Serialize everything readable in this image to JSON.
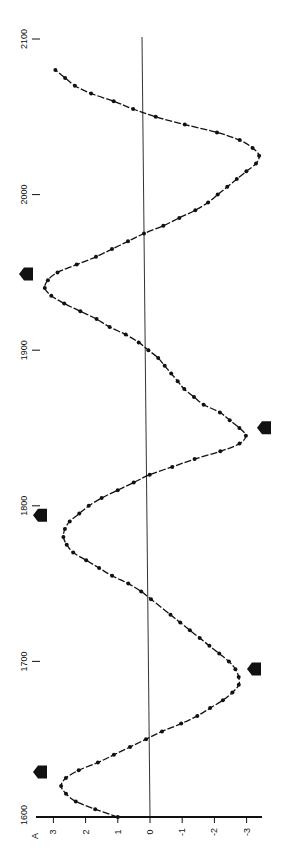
{
  "chart_data": {
    "type": "line",
    "orientation": "rotated-90-ccw",
    "title": "",
    "xlabel": "Year",
    "ylabel": "",
    "x_ticks": [
      "1600",
      "1700",
      "1800",
      "1900",
      "2000",
      "2100"
    ],
    "y_ticks": [
      "3",
      "2",
      "1",
      "0",
      "-1",
      "-2",
      "-3"
    ],
    "y_axis_marker": "A",
    "xlim": [
      1600,
      2100
    ],
    "ylim": [
      -3.7,
      3.3
    ],
    "grid": false,
    "reference_line": 0,
    "series": [
      {
        "name": "cycle",
        "marker": "dot",
        "x": [
          1600,
          1605,
          1610,
          1615,
          1620,
          1625,
          1630,
          1635,
          1640,
          1645,
          1650,
          1655,
          1660,
          1665,
          1670,
          1675,
          1680,
          1685,
          1690,
          1695,
          1700,
          1705,
          1710,
          1715,
          1720,
          1725,
          1730,
          1740,
          1745,
          1750,
          1755,
          1760,
          1765,
          1770,
          1775,
          1780,
          1785,
          1790,
          1795,
          1800,
          1805,
          1810,
          1815,
          1820,
          1825,
          1830,
          1835,
          1840,
          1845,
          1850,
          1855,
          1860,
          1865,
          1870,
          1875,
          1880,
          1885,
          1890,
          1895,
          1900,
          1905,
          1910,
          1915,
          1920,
          1925,
          1930,
          1935,
          1940,
          1945,
          1950,
          1955,
          1960,
          1965,
          1970,
          1975,
          1980,
          1985,
          1990,
          1995,
          2000,
          2005,
          2010,
          2015,
          2020,
          2025,
          2030,
          2035,
          2040,
          2045,
          2050,
          2055,
          2060,
          2065,
          2070,
          2075,
          2080
        ],
        "values": [
          1.0,
          1.7,
          2.3,
          2.6,
          2.75,
          2.6,
          2.2,
          1.6,
          1.1,
          0.6,
          0.1,
          -0.4,
          -1.0,
          -1.5,
          -1.9,
          -2.3,
          -2.6,
          -2.8,
          -2.8,
          -2.7,
          -2.5,
          -2.2,
          -1.9,
          -1.6,
          -1.3,
          -1.0,
          -0.7,
          -0.1,
          0.2,
          0.6,
          1.1,
          1.5,
          1.9,
          2.3,
          2.5,
          2.6,
          2.55,
          2.4,
          2.1,
          1.8,
          1.4,
          0.9,
          0.4,
          -0.1,
          -0.8,
          -1.5,
          -2.3,
          -2.9,
          -3.1,
          -2.9,
          -2.6,
          -2.3,
          -1.8,
          -1.5,
          -1.2,
          -1.0,
          -0.8,
          -0.6,
          -0.4,
          -0.1,
          0.2,
          0.6,
          1.1,
          1.5,
          2.0,
          2.5,
          2.9,
          3.1,
          3.0,
          2.7,
          2.1,
          1.5,
          1.0,
          0.5,
          0.0,
          -0.6,
          -1.1,
          -1.6,
          -2.0,
          -2.3,
          -2.6,
          -2.9,
          -3.2,
          -3.5,
          -3.6,
          -3.4,
          -3.0,
          -2.3,
          -1.3,
          -0.4,
          0.3,
          0.9,
          1.6,
          2.1,
          2.4,
          2.7
        ]
      }
    ],
    "annotations": [
      {
        "type": "arrow",
        "year": 1620,
        "side": "positive",
        "direction": "outward"
      },
      {
        "type": "arrow",
        "year": 1690,
        "side": "negative",
        "direction": "inward"
      },
      {
        "type": "arrow",
        "year": 1785,
        "side": "positive",
        "direction": "outward"
      },
      {
        "type": "arrow",
        "year": 1845,
        "side": "negative",
        "direction": "inward"
      },
      {
        "type": "arrow",
        "year": 1940,
        "side": "positive",
        "direction": "outward"
      }
    ]
  }
}
